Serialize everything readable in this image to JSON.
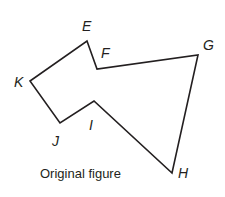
{
  "figure": {
    "caption": "Original figure",
    "stroke_color": "#231f20",
    "vertices": [
      {
        "name": "E",
        "x": 87,
        "y": 41,
        "label_x": 82,
        "label_y": 31
      },
      {
        "name": "F",
        "x": 97,
        "y": 69,
        "label_x": 101,
        "label_y": 58
      },
      {
        "name": "G",
        "x": 198,
        "y": 55,
        "label_x": 203,
        "label_y": 50
      },
      {
        "name": "H",
        "x": 172,
        "y": 173,
        "label_x": 178,
        "label_y": 178
      },
      {
        "name": "I",
        "x": 94,
        "y": 101,
        "label_x": 89,
        "label_y": 130
      },
      {
        "name": "J",
        "x": 60,
        "y": 123,
        "label_x": 52,
        "label_y": 146
      },
      {
        "name": "K",
        "x": 30,
        "y": 81,
        "label_x": 14,
        "label_y": 87
      }
    ]
  },
  "labels": {
    "E": "E",
    "F": "F",
    "G": "G",
    "H": "H",
    "I": "I",
    "J": "J",
    "K": "K"
  }
}
